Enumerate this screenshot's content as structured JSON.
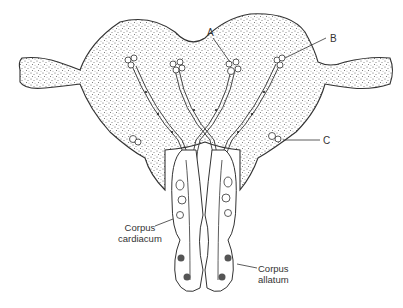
{
  "diagram": {
    "labels": {
      "a": "A",
      "b": "B",
      "c": "C",
      "cc_line1": "Corpus",
      "cc_line2": "cardiacum",
      "ca_line1": "Corpus",
      "ca_line2": "allatum"
    },
    "colors": {
      "outline": "#333333",
      "stipple": "#6a6a6a",
      "background": "#ffffff"
    }
  }
}
